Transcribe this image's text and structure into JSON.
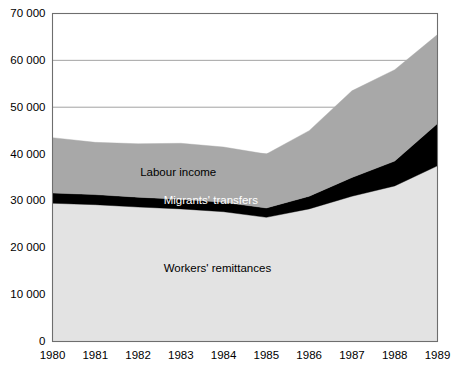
{
  "chart_data": {
    "type": "area",
    "stacked": true,
    "title": "",
    "subtitle": "",
    "xlabel": "",
    "ylabel": "",
    "categories": [
      "1980",
      "1981",
      "1982",
      "1983",
      "1984",
      "1985",
      "1986",
      "1987",
      "1988",
      "1989"
    ],
    "x": [
      1980,
      1981,
      1982,
      1983,
      1984,
      1985,
      1986,
      1987,
      1988,
      1989
    ],
    "xlim": [
      1980,
      1989
    ],
    "ylim": [
      0,
      70000
    ],
    "yticks": [
      0,
      10000,
      20000,
      30000,
      40000,
      50000,
      60000,
      70000
    ],
    "ytick_labels": [
      "0",
      "10 000",
      "20 000",
      "30 000",
      "40 000",
      "50 000",
      "60 000",
      "70 000"
    ],
    "grid": true,
    "legend_position": "inside-labels",
    "series": [
      {
        "name": "Workers' remittances",
        "color": "#e3e3e3",
        "label_color": "#000000",
        "values": [
          29500,
          29200,
          28700,
          28300,
          27700,
          26500,
          28300,
          31000,
          33200,
          37500
        ]
      },
      {
        "name": "Migrants' transfers",
        "color": "#000000",
        "label_color": "#ffffff",
        "values": [
          2200,
          2150,
          2100,
          2050,
          2000,
          2000,
          2700,
          4000,
          5300,
          9000
        ]
      },
      {
        "name": "Labour income",
        "color": "#a8a8a8",
        "label_color": "#000000",
        "values": [
          11800,
          11150,
          11400,
          11950,
          11800,
          11500,
          14000,
          18500,
          19500,
          19000
        ]
      }
    ],
    "cumulative_tops": {
      "workers_remittances": [
        29500,
        29200,
        28700,
        28300,
        27700,
        26500,
        28300,
        31000,
        33200,
        37500
      ],
      "migrants_transfers": [
        31700,
        31350,
        30800,
        30350,
        29700,
        28500,
        31000,
        35000,
        38500,
        46500
      ],
      "total": [
        43500,
        42500,
        42200,
        42300,
        41500,
        40000,
        45000,
        53500,
        58000,
        65500
      ]
    },
    "series_annotations": [
      {
        "text": "Labour income",
        "x_year": 1982.05,
        "y_value": 36000,
        "color": "#000000"
      },
      {
        "text": "Migrants' transfers",
        "x_year": 1982.6,
        "y_value": 29900,
        "color": "#ffffff"
      },
      {
        "text": "Workers' remittances",
        "x_year": 1982.6,
        "y_value": 15500,
        "color": "#000000"
      }
    ]
  },
  "colors": {
    "background": "#ffffff",
    "plot_background": "#ffffff",
    "axis": "#6e6e6e",
    "gridline": "#8c8c8c",
    "band_light": "#e3e3e3",
    "band_black": "#000000",
    "band_gray": "#a8a8a8",
    "text": "#000000"
  }
}
